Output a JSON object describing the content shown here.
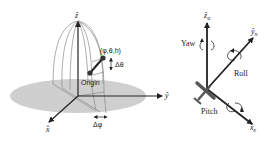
{
  "left_panel": {
    "axes": {
      "z_label": "ẑ",
      "y_label": "ŷ",
      "x_label": "x̂"
    },
    "point_label": "(φ,θ,h)",
    "delta_theta_label": "Δθ",
    "origin_label": "Origin",
    "delta_phi_label": "Δφ"
  },
  "right_panel": {
    "axes": {
      "z_label": "ẑ",
      "z_sub": "u",
      "y_label": "ŷ",
      "y_sub": "n",
      "x_label": "x̂",
      "x_sub": "e"
    },
    "yaw_label": "Yaw",
    "roll_label": "Roll",
    "pitch_label": "Pitch"
  },
  "colors": {
    "plane_fill": "#cfcfcf",
    "axis": "#222222",
    "dome": "#8a8a8a",
    "aircraft": "#555555"
  }
}
